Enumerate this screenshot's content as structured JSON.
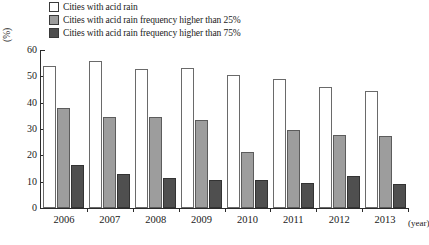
{
  "legend": {
    "items": [
      {
        "label": "Cities with acid rain",
        "swatch": "white-swatch",
        "color": "#ffffff"
      },
      {
        "label": "Cities with acid rain frequency higher than 25%",
        "swatch": "mid-gray-swatch",
        "color": "#9d9d9d"
      },
      {
        "label": "Cities with acid rain frequency higher than 75%",
        "swatch": "dark-gray-swatch",
        "color": "#4f4f4f"
      }
    ]
  },
  "axes": {
    "y_unit": "(%)",
    "x_unit": "(year)",
    "y_ticks": [
      "0",
      "10",
      "20",
      "30",
      "40",
      "50",
      "60"
    ]
  },
  "chart_data": {
    "type": "bar",
    "title": "",
    "xlabel": "(year)",
    "ylabel": "(%)",
    "ylim": [
      0,
      60
    ],
    "ytick_step": 10,
    "grid": false,
    "legend_position": "top",
    "categories": [
      "2006",
      "2007",
      "2008",
      "2009",
      "2010",
      "2011",
      "2012",
      "2013"
    ],
    "series": [
      {
        "name": "Cities with acid rain",
        "color": "#ffffff",
        "values": [
          54.0,
          55.8,
          52.8,
          53.2,
          50.4,
          48.9,
          45.9,
          44.4
        ]
      },
      {
        "name": "Cities with acid rain frequency higher than 25%",
        "color": "#9d9d9d",
        "values": [
          38.0,
          34.5,
          34.4,
          33.4,
          21.4,
          29.8,
          27.9,
          27.3
        ]
      },
      {
        "name": "Cities with acid rain frequency higher than 75%",
        "color": "#4f4f4f",
        "values": [
          16.4,
          12.9,
          11.5,
          10.8,
          10.7,
          9.5,
          12.0,
          9.1
        ]
      }
    ]
  }
}
